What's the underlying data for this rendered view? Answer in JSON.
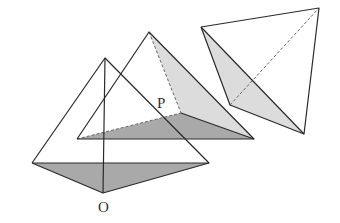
{
  "figure": {
    "labels": {
      "O": "O",
      "P": "P"
    },
    "colors": {
      "line": "#2a2a2a",
      "dashed": "#666666",
      "shade_dark": "#a9a9a9",
      "shade_light": "#dcdcdc",
      "background": "#ffffff"
    }
  }
}
